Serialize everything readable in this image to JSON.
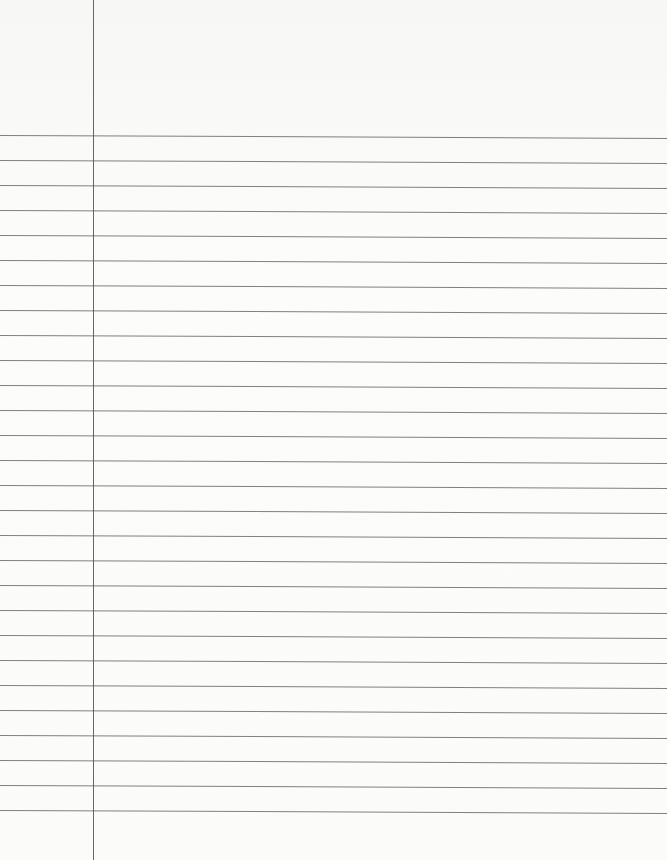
{
  "paper": {
    "type": "lined-notebook-paper",
    "background_color": "#fbfbfa",
    "rule_color": "#6a6a6a",
    "margin_line_color": "#555555",
    "margin_line_x": 93,
    "first_rule_y": 135,
    "rule_spacing": 25,
    "rule_count": 28
  }
}
